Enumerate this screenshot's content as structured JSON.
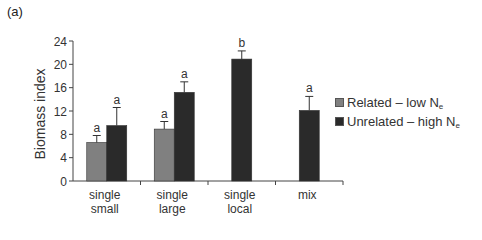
{
  "panel_label": "(a)",
  "chart_data": {
    "type": "bar",
    "title": "",
    "xlabel": "",
    "ylabel": "Biomass index",
    "ylim": [
      0,
      24
    ],
    "yticks": [
      0,
      4,
      8,
      12,
      16,
      20,
      24
    ],
    "grid": false,
    "legend_position": "right",
    "categories": [
      "single\nsmall",
      "single\nlarge",
      "single\nlocal",
      "mix"
    ],
    "category_lines": [
      [
        "single",
        "small"
      ],
      [
        "single",
        "large"
      ],
      [
        "single",
        "local"
      ],
      [
        "mix"
      ]
    ],
    "series": [
      {
        "name": "Related – low Ne",
        "label_main": "Related – low N",
        "label_sub": "e",
        "color": "#808080",
        "values": [
          6.6,
          8.9,
          null,
          null
        ],
        "error_upper": [
          7.8,
          10.2,
          null,
          null
        ],
        "letters": [
          "a",
          "a",
          null,
          null
        ]
      },
      {
        "name": "Unrelated – high Ne",
        "label_main": "Unrelated – high N",
        "label_sub": "e",
        "color": "#2a2a2a",
        "values": [
          9.5,
          15.2,
          20.9,
          12.1
        ],
        "error_upper": [
          12.6,
          17.0,
          22.3,
          14.5
        ],
        "letters": [
          "a",
          "a",
          "b",
          "a"
        ]
      }
    ]
  }
}
